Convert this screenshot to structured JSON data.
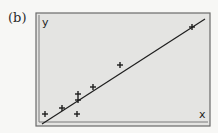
{
  "figure": {
    "panel_label": "(b)"
  },
  "chart_data": {
    "type": "scatter",
    "title": "",
    "xlabel": "x",
    "ylabel": "y",
    "grid": false,
    "legend": null,
    "axis_ticks": "none",
    "points_pixel": [
      {
        "x": 45,
        "y": 114
      },
      {
        "x": 62,
        "y": 108
      },
      {
        "x": 78,
        "y": 94
      },
      {
        "x": 78,
        "y": 100
      },
      {
        "x": 77,
        "y": 114
      },
      {
        "x": 93,
        "y": 87
      },
      {
        "x": 120,
        "y": 65
      },
      {
        "x": 192,
        "y": 27
      }
    ],
    "fit_line_pixel": {
      "x1": 42,
      "y1": 124,
      "x2": 205,
      "y2": 19
    },
    "marker": "+",
    "colors": {
      "plot_background": "#e4e4e2",
      "frame": "#6a6a6a",
      "ink": "#1e1e1e"
    }
  }
}
